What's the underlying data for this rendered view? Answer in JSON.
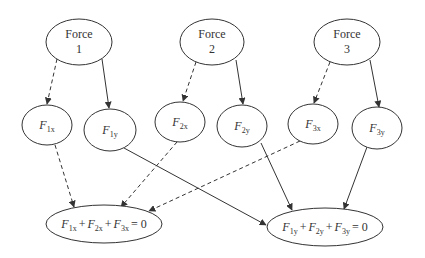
{
  "diagram": {
    "type": "flow-diagram",
    "colors": {
      "stroke": "#333333",
      "background": "#ffffff"
    },
    "forces": [
      {
        "id": "force1",
        "line1": "Force",
        "line2": "1"
      },
      {
        "id": "force2",
        "line1": "Force",
        "line2": "2"
      },
      {
        "id": "force3",
        "line1": "Force",
        "line2": "3"
      }
    ],
    "components": [
      {
        "id": "f1x",
        "symbol": "F",
        "sub": "1x"
      },
      {
        "id": "f1y",
        "symbol": "F",
        "sub": "1y"
      },
      {
        "id": "f2x",
        "symbol": "F",
        "sub": "2x"
      },
      {
        "id": "f2y",
        "symbol": "F",
        "sub": "2y"
      },
      {
        "id": "f3x",
        "symbol": "F",
        "sub": "3x"
      },
      {
        "id": "f3y",
        "symbol": "F",
        "sub": "3y"
      }
    ],
    "equations": {
      "x": {
        "terms": [
          {
            "symbol": "F",
            "sub": "1x"
          },
          {
            "symbol": "F",
            "sub": "2x"
          },
          {
            "symbol": "F",
            "sub": "3x"
          }
        ],
        "plus": "+",
        "rhs": "= 0"
      },
      "y": {
        "terms": [
          {
            "symbol": "F",
            "sub": "1y"
          },
          {
            "symbol": "F",
            "sub": "2y"
          },
          {
            "symbol": "F",
            "sub": "3y"
          }
        ],
        "plus": "+",
        "rhs": "= 0"
      }
    },
    "edges": [
      {
        "from": "force1",
        "to": "f1x",
        "style": "dashed"
      },
      {
        "from": "force1",
        "to": "f1y",
        "style": "solid"
      },
      {
        "from": "force2",
        "to": "f2x",
        "style": "dashed"
      },
      {
        "from": "force2",
        "to": "f2y",
        "style": "solid"
      },
      {
        "from": "force3",
        "to": "f3x",
        "style": "dashed"
      },
      {
        "from": "force3",
        "to": "f3y",
        "style": "solid"
      },
      {
        "from": "f1x",
        "to": "sum_x",
        "style": "dashed"
      },
      {
        "from": "f2x",
        "to": "sum_x",
        "style": "dashed"
      },
      {
        "from": "f3x",
        "to": "sum_x",
        "style": "dashed"
      },
      {
        "from": "f1y",
        "to": "sum_y",
        "style": "solid"
      },
      {
        "from": "f2y",
        "to": "sum_y",
        "style": "solid"
      },
      {
        "from": "f3y",
        "to": "sum_y",
        "style": "solid"
      }
    ]
  }
}
